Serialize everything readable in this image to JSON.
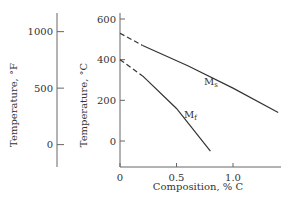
{
  "chart_data": {
    "type": "line",
    "xlabel": "Composition, % C",
    "ylabel": "Temperature, °C",
    "ylabel_secondary": "Temperature, °F",
    "xlim": [
      0,
      1.4
    ],
    "ylim": [
      -130,
      600
    ],
    "xticks": [
      0,
      0.5,
      1.0
    ],
    "xtick_labels": [
      "0",
      "0.5",
      "1.0"
    ],
    "yticks": [
      0,
      200,
      400,
      600
    ],
    "ytick_labels": [
      "0",
      "200",
      "400",
      "600"
    ],
    "yticks_secondary_F": [
      0,
      500,
      1000
    ],
    "ytick_labels_secondary": [
      "0",
      "500",
      "1000"
    ],
    "series": [
      {
        "name": "Ms",
        "label": "Ms",
        "dashed_segment": [
          [
            0,
            530
          ],
          [
            0.2,
            470
          ]
        ],
        "points": [
          [
            0.2,
            470
          ],
          [
            0.6,
            370
          ],
          [
            1.0,
            260
          ],
          [
            1.4,
            140
          ]
        ]
      },
      {
        "name": "Mf",
        "label": "Mf",
        "dashed_segment": [
          [
            0,
            400
          ],
          [
            0.2,
            320
          ]
        ],
        "points": [
          [
            0.2,
            320
          ],
          [
            0.5,
            160
          ],
          [
            0.8,
            -50
          ]
        ]
      }
    ]
  }
}
